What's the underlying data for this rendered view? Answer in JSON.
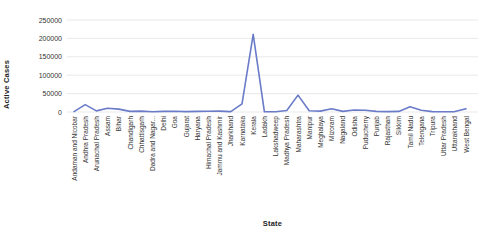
{
  "chart_data": {
    "type": "line",
    "title": "",
    "xlabel": "State",
    "ylabel": "Active Cases",
    "ylim": [
      0,
      250000
    ],
    "yticks": [
      0,
      50000,
      100000,
      150000,
      200000,
      250000
    ],
    "grid": "horizontal",
    "legend": "none",
    "line_color": "#6a7bc8",
    "grid_color": "#e9e9e9",
    "tick_label_color": "#333333",
    "categories": [
      "Andaman and Nicobar",
      "Andhra Pradesh",
      "Arunachal Pradesh",
      "Assam",
      "Bihar",
      "Chandigarh",
      "Chhattisgarh",
      "Dadra and Nagar...",
      "Delhi",
      "Goa",
      "Gujarat",
      "Haryana",
      "Himachal Pradesh",
      "Jammu and Kashmir",
      "Jharkhand",
      "Karnataka",
      "Kerala",
      "Ladakh",
      "Lakshadweep",
      "Madhya Pradesh",
      "Maharashtra",
      "Manipur",
      "Meghalaya",
      "Mizoram",
      "Nagaland",
      "Odisha",
      "Puducherry",
      "Punjab",
      "Rajasthan",
      "Sikkim",
      "Tamil Nadu",
      "Telengana",
      "Tripura",
      "Uttar Pradesh",
      "Uttarakhand",
      "West Bengal"
    ],
    "values": [
      1000,
      20000,
      3000,
      10000,
      8000,
      1500,
      2500,
      500,
      1500,
      2000,
      1000,
      1500,
      2000,
      2500,
      1000,
      22000,
      211000,
      500,
      500,
      4000,
      46000,
      3500,
      2500,
      9000,
      1500,
      5500,
      4500,
      1500,
      1000,
      1500,
      14000,
      5000,
      1000,
      500,
      1000,
      9000
    ]
  }
}
